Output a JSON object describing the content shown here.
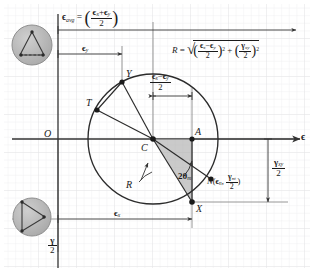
{
  "figure": {
    "type": "mohrs-circle-strain-diagram",
    "background_color": "#ffffff",
    "grid_color": "#ececed",
    "ink_color": "#1a1a1a",
    "shade_color": "#a8a8a8",
    "badge_fill": "#b5b5b5"
  },
  "axes": {
    "horizontal_label": "ϵ",
    "vertical_label_num": "γ",
    "vertical_label_den": "2",
    "origin_label": "O"
  },
  "formulas": {
    "eps_avg": {
      "lhs": "ϵ",
      "lhs_sub": "avg",
      "equals": "=",
      "num_a": "ϵ",
      "num_a_sub": "x",
      "plus": "+",
      "num_b": "ϵ",
      "num_b_sub": "y",
      "den": "2"
    },
    "radius": {
      "lhs": "R",
      "equals": "=",
      "radical": "√",
      "t1_num_a": "ϵ",
      "t1_num_a_sub": "x",
      "t1_minus": "−",
      "t1_num_b": "ϵ",
      "t1_num_b_sub": "y",
      "t1_den": "2",
      "t1_exp": "2",
      "plus": "+",
      "t2_num": "γ",
      "t2_num_sub": "xy",
      "t2_den": "2",
      "t2_exp": "2"
    }
  },
  "dimension_labels": {
    "eps_y": {
      "sym": "ϵ",
      "sub": "y"
    },
    "eps_x": {
      "sym": "ϵ",
      "sub": "x"
    },
    "half_diff": {
      "num_a": "ϵ",
      "num_a_sub": "x",
      "minus": "−",
      "num_b": "ϵ",
      "num_b_sub": "y",
      "den": "2"
    },
    "half_gamma_xy": {
      "num": "γ",
      "num_sub": "xy",
      "den": "2"
    }
  },
  "points": [
    {
      "id": "Y",
      "label": "Y",
      "x": 122,
      "y": 82,
      "label_dx": 4,
      "label_dy": -13,
      "dot": true
    },
    {
      "id": "T",
      "label": "T",
      "x": 97,
      "y": 110,
      "label_dx": -11,
      "label_dy": -12,
      "dot": true
    },
    {
      "id": "C",
      "label": "C",
      "x": 153,
      "y": 139,
      "label_dx": -12,
      "label_dy": 4,
      "dot": true
    },
    {
      "id": "A",
      "label": "A",
      "x": 192,
      "y": 139,
      "label_dx": 3,
      "label_dy": -12,
      "dot": true
    },
    {
      "id": "X",
      "label": "X",
      "x": 192,
      "y": 202,
      "label_dx": 4,
      "label_dy": 6,
      "dot": true
    },
    {
      "id": "N",
      "label": "N",
      "x": 211,
      "y": 179,
      "label_dx": 0,
      "label_dy": 0,
      "dot": true
    }
  ],
  "annotations": {
    "radius_leader": "R",
    "angle": {
      "two": "2",
      "theta": "θ",
      "sub": "m"
    },
    "point_N": {
      "name": "N",
      "open": "(",
      "coord1": "ϵ",
      "coord1_sub": "n",
      "comma": ",",
      "coord2_num": "γ",
      "coord2_num_sub": "nt",
      "coord2_den": "2",
      "close": ")"
    }
  },
  "badges": [
    {
      "id": "badge-top",
      "name": "element-shear-badge-top",
      "cx": 32,
      "cy": 45,
      "r": 20
    },
    {
      "id": "badge-bottom",
      "name": "element-shear-badge-bottom",
      "cx": 32,
      "cy": 217,
      "r": 19
    }
  ],
  "geometry": {
    "circle": {
      "cx": 153,
      "cy": 139,
      "r": 65
    },
    "eps_axis_y": 139,
    "gamma_axis_x": 58,
    "eps_avg_arrow_y": 30,
    "eps_y_arrow_y": 54,
    "eps_x_arrow_y": 219,
    "half_diff_arrow_y": 96,
    "gamma_xy_bracket_x": 268
  }
}
